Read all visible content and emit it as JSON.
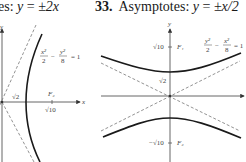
{
  "left_panel": {
    "header_prefix": "es: ",
    "header_eq_lhs": "y",
    "header_eq_mid": " = ",
    "header_eq_rhs": "±2x",
    "equation": {
      "lhs_num1": "x²",
      "lhs_den1": "2",
      "minus": "−",
      "lhs_num2": "y²",
      "lhs_den2": "8",
      "rhs": "= 1"
    },
    "axis_x_label": "x",
    "axis_y_label": "y",
    "vertex_label": "√2",
    "focus_label": "F₂",
    "focus_value_label": "√10"
  },
  "right_panel": {
    "problem_number": "33.",
    "header_prefix": "Asymptotes: ",
    "header_eq_lhs": "y",
    "header_eq_mid": " = ",
    "header_eq_rhs": "±x/2",
    "equation": {
      "lhs_num1": "y²",
      "lhs_den1": "2",
      "minus": "−",
      "lhs_num2": "x²",
      "lhs_den2": "8",
      "rhs": "= 1"
    },
    "axis_y_label": "y",
    "vertex_label": "√2",
    "focus1_value_label": "√10",
    "focus1_label": "F₁",
    "focus2_value_label": "−√10",
    "focus2_label": "F₂"
  },
  "colors": {
    "curve": "#1a1a1a",
    "axis": "#555555",
    "asymptote": "#777777",
    "text": "#1a1a1a"
  }
}
